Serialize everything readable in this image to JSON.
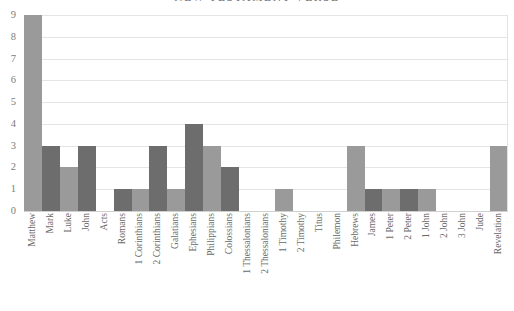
{
  "chart": {
    "title": "NEW TESTAMENT VERSE"
  },
  "chart_data": {
    "type": "bar",
    "title": "NEW TESTAMENT VERSE",
    "xlabel": "",
    "ylabel": "",
    "ylim": [
      0,
      9
    ],
    "yticks": [
      0,
      1,
      2,
      3,
      4,
      5,
      6,
      7,
      8,
      9
    ],
    "grid": true,
    "legend": "none",
    "bar_colors": [
      "#9a9a9a",
      "#6d6d6d"
    ],
    "categories": [
      "Matthew",
      "Mark",
      "Luke",
      "John",
      "Acts",
      "Romans",
      "1 Corinthians",
      "2 Corinthians",
      "Galatians",
      "Ephesians",
      "Philippians",
      "Colossians",
      "1 Thessalonians",
      "2 Thessalonians",
      "1 Timothy",
      "2 Timothy",
      "Titus",
      "Philemon",
      "Hebrews",
      "James",
      "1 Peter",
      "2 Peter",
      "1 John",
      "2 John",
      "3 John",
      "Jude",
      "Revelation"
    ],
    "values": [
      9,
      3,
      2,
      3,
      0,
      1,
      1,
      3,
      1,
      4,
      3,
      2,
      0,
      0,
      1,
      0,
      0,
      0,
      3,
      1,
      1,
      1,
      1,
      0,
      0,
      0,
      3
    ]
  }
}
